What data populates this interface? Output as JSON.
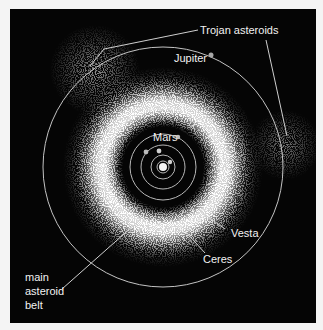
{
  "diagram": {
    "type": "solar-system-asteroid-belt",
    "background_color": "#050505",
    "page_color": "#f4f4f4",
    "sun": {
      "cx": 163,
      "cy": 167
    },
    "orbits": [
      {
        "name": "mercury-orbit",
        "r": 6
      },
      {
        "name": "venus-orbit",
        "r": 12
      },
      {
        "name": "earth-orbit",
        "r": 22
      },
      {
        "name": "mars-orbit",
        "r": 33
      },
      {
        "name": "jupiter-orbit",
        "r": 120
      }
    ],
    "labels": {
      "trojan": "Trojan asteroids",
      "jupiter": "Jupiter",
      "mars": "Mars",
      "vesta": "Vesta",
      "ceres": "Ceres",
      "belt_line1": "main",
      "belt_line2": "asteroid",
      "belt_line3": "belt"
    }
  }
}
